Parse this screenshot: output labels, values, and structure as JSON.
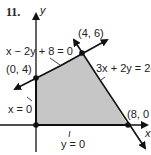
{
  "problem_number": "11.",
  "axes": {
    "x_label": "x",
    "y_label": "y"
  },
  "colors": {
    "region_fill": "#c6c6c6",
    "line": "#111111",
    "background": "#ffffff"
  },
  "vertices": [
    {
      "label": "(0, 4)",
      "x": 0,
      "y": 4
    },
    {
      "label": "(4, 6)",
      "x": 4,
      "y": 6
    },
    {
      "label": "(8, 0",
      "x": 8,
      "y": 0
    },
    {
      "label": "",
      "x": 0,
      "y": 0
    }
  ],
  "constraints": [
    {
      "label": "x − 2y + 8 = 0"
    },
    {
      "label": "3x + 2y = 24"
    },
    {
      "label": "x = 0"
    },
    {
      "label": "y = 0"
    }
  ]
}
